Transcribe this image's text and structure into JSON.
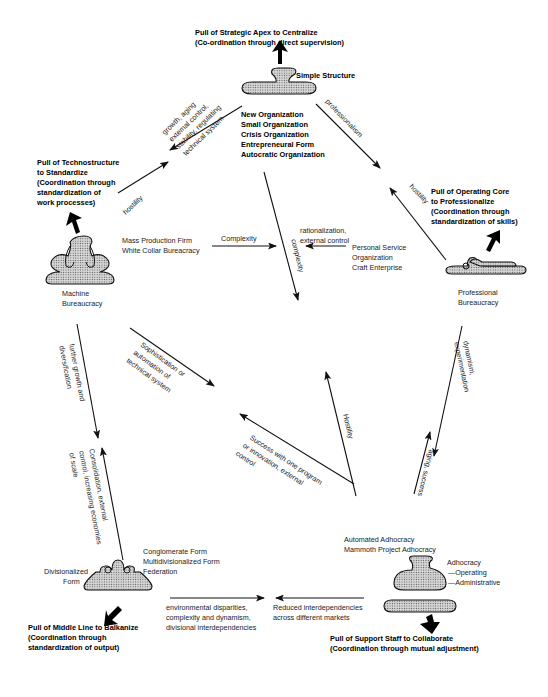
{
  "diagram": {
    "pulls": {
      "strategic_apex": {
        "line1": "Pull of Strategic Apex to Centralize",
        "line2": "(Co-ordination through direct supervision)"
      },
      "technostructure": {
        "line1": "Pull of Technostructure",
        "line2": "to Standardize",
        "line3": "(Coordination through",
        "line4": "standardization of",
        "line5": "work processes)"
      },
      "operating_core": {
        "line1": "Pull of Operating Core",
        "line2": "to Professionalize",
        "line3": "(Coordination through",
        "line4": "standardization of skills)"
      },
      "middle_line": {
        "line1": "Pull of Middle Line to Balkanize",
        "line2": "(Coordination through",
        "line3": "standardization of output)"
      },
      "support_staff": {
        "line1": "Pull of Support Staff to Collaborate",
        "line2": "(Coordination through mutual adjustment)"
      }
    },
    "configurations": {
      "simple_structure": {
        "name": "Simple Structure",
        "variants": [
          "New Organization",
          "Small Organization",
          "Crisis Organization",
          "Entrepreneural Form",
          "Autocratic Organization"
        ]
      },
      "machine_bureaucracy": {
        "line1": "Machine",
        "line2": "Bureaucracy",
        "variants": [
          "Mass Production Firm",
          "White Collar Bureacracy"
        ]
      },
      "professional_bureaucracy": {
        "line1": "Professional",
        "line2": "Bureaucracy",
        "variants": [
          "Personal Service",
          "Organization",
          "Craft Enterprise"
        ]
      },
      "divisionalized_form": {
        "line1": "Divisionalized",
        "line2": "Form",
        "variants": [
          "Conglomerate Form",
          "Multidivisionalized Form",
          "Federation"
        ]
      },
      "adhocracy": {
        "name": "Adhocracy",
        "sub1": "—Operating",
        "sub2": "—Administrative",
        "variants": [
          "Automated Adhocracy",
          "Mammoth Project Adhocracy"
        ]
      }
    },
    "transitions": {
      "simple_to_machine": {
        "l1": "growth, aging",
        "l2": "external control,",
        "l3": "stability, regulating",
        "l4": "technical system"
      },
      "machine_to_simple": "hostility",
      "simple_to_professional": "professionalism",
      "professional_to_simple": "hostility",
      "machine_to_center": "Complexity",
      "professional_to_center": {
        "l1": "rationalization,",
        "l2": "external control"
      },
      "simple_down": "complexity",
      "machine_to_adhocracy": {
        "l1": "Sophistication or",
        "l2": "automation of",
        "l3": "technical system"
      },
      "machine_to_divisional": {
        "l1": "further growth and",
        "l2": "diversification"
      },
      "divisional_to_machine": {
        "l1": "Consolidation, external",
        "l2": "control, increasing economies",
        "l3": "of scale"
      },
      "adhocracy_to_machine": {
        "l1": "Success with one program",
        "l2": "or innovation, external",
        "l3": "control"
      },
      "adhocracy_to_simple": "Hostility",
      "professional_to_adhocracy": {
        "l1": "dynamism,",
        "l2": "experimentation"
      },
      "adhocracy_to_professional": "aging, success",
      "divisional_to_center": {
        "l1": "environmental disparities,",
        "l2": "complexity and dynamism,",
        "l3": "divisional interdependencies"
      },
      "adhocracy_to_center": {
        "l1": "Reduced interdependencies",
        "l2": "across different markets"
      }
    },
    "colors": {
      "ink": "#111111",
      "background": "#ffffff"
    }
  }
}
